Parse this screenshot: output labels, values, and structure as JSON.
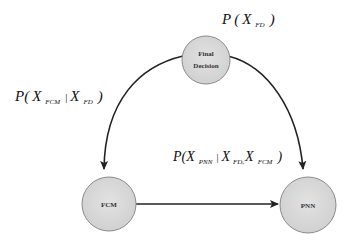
{
  "diagram": {
    "type": "bayesian-network",
    "nodes": [
      {
        "id": "fd",
        "label_line1": "Final",
        "label_line2": "Decision",
        "cx": 206,
        "cy": 60,
        "r": 24
      },
      {
        "id": "fcm",
        "label": "FCM",
        "cx": 109,
        "cy": 204,
        "r": 27
      },
      {
        "id": "pnn",
        "label": "PNN",
        "cx": 308,
        "cy": 205,
        "r": 28
      }
    ],
    "edges": [
      {
        "from": "fd",
        "to": "fcm",
        "style": "curved"
      },
      {
        "from": "fd",
        "to": "pnn",
        "style": "curved"
      },
      {
        "from": "fcm",
        "to": "pnn",
        "style": "straight"
      }
    ],
    "colors": {
      "node_fill": "#d6d6d6",
      "node_stroke": "#8a8a8a",
      "edge": "#222222",
      "background": "#ffffff"
    }
  },
  "labels": {
    "p_fd": {
      "P": "P",
      "open": "(",
      "X": "X",
      "sub": "FD",
      "close": ")"
    },
    "p_fcm_given_fd": {
      "P": "P",
      "open": "(",
      "X1": "X",
      "sub1": "FCM",
      "bar": "|",
      "X2": "X",
      "sub2": "FD",
      "close": ")"
    },
    "p_pnn_given_fd_fcm": {
      "P": "P",
      "open": "(",
      "X1": "X",
      "sub1": "PNN",
      "bar": "|",
      "X2": "X",
      "sub2": "FD,",
      "X3": "X",
      "sub3": "FCM",
      "close": ")"
    }
  }
}
